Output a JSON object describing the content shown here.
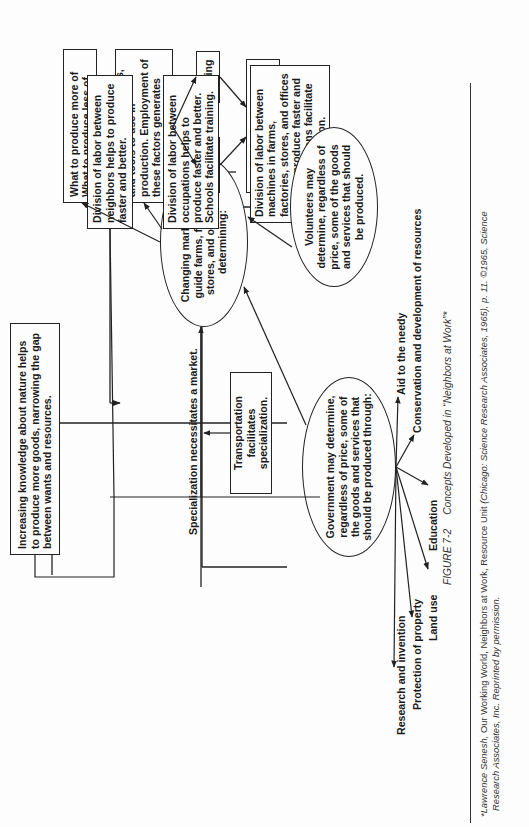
{
  "diagram": {
    "top_row": {
      "knowledge": "Increasing knowledge about nature helps to produce more goods, narrowing the gap between wants and resources.",
      "specialization_label": "Specialization necessitates a market.",
      "transportation": "Transportation facilitates specialization.",
      "market_ellipse": "Changing market prices guide farms, factories, stores, and offices in determining:",
      "what_to_produce": "What to produce more of What to produce less of",
      "how_much": "How much land, workers, and tools to use in production. Employment of these factors generates income for:",
      "saving": "Saving",
      "spending": "Spending",
      "determine_level_pre": "which determine level of",
      "determine_level_em": "income and employment."
    },
    "division_boxes": [
      "Division of labor between neighbors helps to produce faster and better.",
      "Division of labor between occupations helps to produce faster and better. Schools facilitate training.",
      "Division of labor between machines in farms, factories, stores, and offices helps to produce faster and better. Inventions facilitate such specialization."
    ],
    "volunteers": "Volunteers may determine, regardless of price, some of the goods and services that should be produced.",
    "government": "Government may determine, regardless of price, some of the goods and services that should be produced through:",
    "government_items": [
      "Research and invention",
      "Protection of property",
      "Land use",
      "Education",
      "Conservation and development of resources",
      "Aid to the needy"
    ]
  },
  "caption": {
    "figure": "FIGURE 7-2",
    "title": "Concepts Developed in “Neighbors at Work”*"
  },
  "footnote": {
    "line1_author": "*Lawrence Senesh,",
    "line1_rest": " Our Working World, Neighbors at Work, Resource Unit ",
    "line1_pub": "(Chicago: Science Research Associates, 1965), p. 11.  ©1965, Science",
    "line2": "Research Associates, Inc.  Reprinted by permission."
  }
}
